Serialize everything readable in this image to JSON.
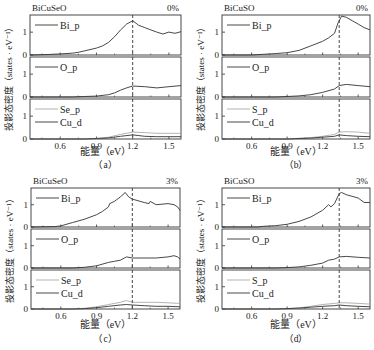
{
  "figure": {
    "ylabel": "投影态密度（states · eV⁻¹）",
    "xlabel": "能量（eV）",
    "xticks": [
      0.6,
      0.9,
      1.2,
      1.5
    ],
    "xlim": [
      0.35,
      1.6
    ],
    "ylim": [
      0,
      1.75
    ],
    "yticks": [
      0,
      1
    ]
  },
  "chart_data": [
    {
      "type": "line",
      "id": "a",
      "caption": "（a）",
      "title": "BiCuSeO",
      "strain": "0%",
      "fermi_dashed_x": 1.2,
      "xlabel": "能量（eV）",
      "ylabel": "投影态密度（states · eV⁻¹）",
      "xlim": [
        0.35,
        1.6
      ],
      "ylim": [
        0,
        1.75
      ],
      "panels": [
        {
          "series": [
            {
              "name": "Bi_p",
              "color": "#333333",
              "x": [
                0.35,
                0.5,
                0.6,
                0.7,
                0.75,
                0.8,
                0.9,
                0.95,
                1.0,
                1.05,
                1.1,
                1.15,
                1.2,
                1.25,
                1.3,
                1.35,
                1.4,
                1.45,
                1.5,
                1.55,
                1.6
              ],
              "y": [
                0,
                0.02,
                0.05,
                0.08,
                0.12,
                0.18,
                0.3,
                0.4,
                0.55,
                0.8,
                1.1,
                1.35,
                1.5,
                1.3,
                1.2,
                1.1,
                1.0,
                0.92,
                1.0,
                0.95,
                1.02
              ]
            }
          ]
        },
        {
          "series": [
            {
              "name": "O_p",
              "color": "#333333",
              "x": [
                0.35,
                0.7,
                0.8,
                0.9,
                1.0,
                1.05,
                1.1,
                1.15,
                1.2,
                1.3,
                1.4,
                1.5,
                1.6
              ],
              "y": [
                0,
                0,
                0.02,
                0.04,
                0.1,
                0.18,
                0.3,
                0.4,
                0.48,
                0.45,
                0.4,
                0.45,
                0.5
              ]
            }
          ]
        },
        {
          "series": [
            {
              "name": "Se_p",
              "color": "#aaaaaa",
              "x": [
                0.35,
                0.8,
                0.9,
                1.0,
                1.1,
                1.2,
                1.3,
                1.4,
                1.5,
                1.6
              ],
              "y": [
                0,
                0,
                0.02,
                0.08,
                0.2,
                0.3,
                0.28,
                0.25,
                0.25,
                0.25
              ]
            },
            {
              "name": "Cu_d",
              "color": "#333333",
              "x": [
                0.35,
                0.8,
                0.9,
                1.0,
                1.1,
                1.2,
                1.3,
                1.4,
                1.5,
                1.6
              ],
              "y": [
                0,
                0,
                0.02,
                0.05,
                0.12,
                0.18,
                0.12,
                0.1,
                0.1,
                0.1
              ]
            }
          ]
        }
      ]
    },
    {
      "type": "line",
      "id": "b",
      "caption": "（b）",
      "title": "BiCuSO",
      "strain": "0%",
      "fermi_dashed_x": 1.34,
      "xlabel": "能量（eV）",
      "ylabel": "投影态密度（states · eV⁻¹）",
      "xlim": [
        0.35,
        1.6
      ],
      "ylim": [
        0,
        1.75
      ],
      "panels": [
        {
          "series": [
            {
              "name": "Bi_p",
              "color": "#333333",
              "x": [
                0.35,
                0.6,
                0.7,
                0.8,
                0.9,
                1.0,
                1.1,
                1.2,
                1.25,
                1.3,
                1.33,
                1.36,
                1.4,
                1.45,
                1.5,
                1.55,
                1.6
              ],
              "y": [
                0,
                0,
                0.03,
                0.06,
                0.1,
                0.2,
                0.4,
                0.6,
                0.75,
                0.95,
                1.4,
                1.7,
                1.65,
                1.5,
                1.35,
                1.2,
                1.1
              ]
            }
          ]
        },
        {
          "series": [
            {
              "name": "O_p",
              "color": "#333333",
              "x": [
                0.35,
                0.8,
                0.9,
                1.0,
                1.1,
                1.2,
                1.3,
                1.34,
                1.4,
                1.5,
                1.6
              ],
              "y": [
                0,
                0,
                0.02,
                0.05,
                0.1,
                0.2,
                0.35,
                0.5,
                0.55,
                0.5,
                0.45
              ]
            }
          ]
        },
        {
          "series": [
            {
              "name": "S_p",
              "color": "#aaaaaa",
              "x": [
                0.35,
                0.9,
                1.0,
                1.1,
                1.2,
                1.3,
                1.34,
                1.4,
                1.5,
                1.6
              ],
              "y": [
                0,
                0,
                0.03,
                0.06,
                0.12,
                0.2,
                0.3,
                0.32,
                0.3,
                0.25
              ]
            },
            {
              "name": "Cu_d",
              "color": "#333333",
              "x": [
                0.35,
                0.9,
                1.0,
                1.1,
                1.2,
                1.3,
                1.34,
                1.4,
                1.5,
                1.6
              ],
              "y": [
                0,
                0,
                0.02,
                0.04,
                0.08,
                0.12,
                0.18,
                0.15,
                0.12,
                0.1
              ]
            }
          ]
        }
      ]
    },
    {
      "type": "line",
      "id": "c",
      "caption": "（c）",
      "title": "BiCuSeO",
      "strain": "3%",
      "fermi_dashed_x": 1.2,
      "xlabel": "能量（eV）",
      "ylabel": "投影态密度（states · eV⁻¹）",
      "xlim": [
        0.35,
        1.6
      ],
      "ylim": [
        0,
        1.75
      ],
      "panels": [
        {
          "series": [
            {
              "name": "Bi_p",
              "color": "#333333",
              "x": [
                0.35,
                0.55,
                0.6,
                0.7,
                0.8,
                0.9,
                0.95,
                1.0,
                1.01,
                1.05,
                1.1,
                1.14,
                1.17,
                1.2,
                1.3,
                1.34,
                1.35,
                1.4,
                1.5,
                1.55,
                1.58,
                1.6
              ],
              "y": [
                0,
                0.02,
                0.05,
                0.2,
                0.35,
                0.55,
                0.7,
                0.9,
                1.05,
                1.15,
                1.35,
                1.55,
                1.35,
                1.25,
                1.1,
                1.05,
                1.15,
                1.0,
                1.05,
                1.0,
                0.9,
                0.75
              ]
            }
          ]
        },
        {
          "series": [
            {
              "name": "O_p",
              "color": "#333333",
              "x": [
                0.35,
                0.7,
                0.8,
                0.9,
                1.0,
                1.05,
                1.1,
                1.15,
                1.2,
                1.3,
                1.4,
                1.5,
                1.55,
                1.58,
                1.6
              ],
              "y": [
                0,
                0,
                0.03,
                0.1,
                0.25,
                0.3,
                0.35,
                0.5,
                0.45,
                0.45,
                0.45,
                0.5,
                0.55,
                0.5,
                0.4
              ]
            }
          ]
        },
        {
          "series": [
            {
              "name": "Se_p",
              "color": "#aaaaaa",
              "x": [
                0.35,
                0.7,
                0.8,
                0.9,
                1.0,
                1.1,
                1.15,
                1.2,
                1.3,
                1.4,
                1.5,
                1.6
              ],
              "y": [
                0,
                0,
                0.03,
                0.1,
                0.2,
                0.3,
                0.38,
                0.3,
                0.3,
                0.3,
                0.28,
                0.25
              ]
            },
            {
              "name": "Cu_d",
              "color": "#333333",
              "x": [
                0.35,
                0.7,
                0.8,
                0.9,
                1.0,
                1.1,
                1.15,
                1.2,
                1.3,
                1.4,
                1.5,
                1.6
              ],
              "y": [
                0,
                0,
                0.02,
                0.06,
                0.12,
                0.18,
                0.2,
                0.18,
                0.15,
                0.12,
                0.12,
                0.1
              ]
            }
          ]
        }
      ]
    },
    {
      "type": "line",
      "id": "d",
      "caption": "（d）",
      "title": "BiCuSO",
      "strain": "3%",
      "fermi_dashed_x": 1.34,
      "xlabel": "能量（eV）",
      "ylabel": "投影态密度（states · eV⁻¹）",
      "xlim": [
        0.35,
        1.6
      ],
      "ylim": [
        0,
        1.75
      ],
      "panels": [
        {
          "series": [
            {
              "name": "Bi_p",
              "color": "#333333",
              "x": [
                0.35,
                0.65,
                0.7,
                0.8,
                0.9,
                1.0,
                1.1,
                1.2,
                1.25,
                1.27,
                1.3,
                1.34,
                1.36,
                1.4,
                1.5,
                1.55,
                1.6
              ],
              "y": [
                0,
                0,
                0.03,
                0.06,
                0.12,
                0.25,
                0.45,
                0.75,
                1.0,
                0.9,
                1.05,
                1.5,
                1.55,
                1.45,
                1.3,
                1.1,
                1.1
              ]
            }
          ]
        },
        {
          "series": [
            {
              "name": "O_p",
              "color": "#333333",
              "x": [
                0.35,
                0.8,
                0.9,
                1.0,
                1.1,
                1.2,
                1.25,
                1.3,
                1.34,
                1.4,
                1.5,
                1.6
              ],
              "y": [
                0,
                0,
                0.02,
                0.05,
                0.12,
                0.22,
                0.35,
                0.4,
                0.5,
                0.52,
                0.48,
                0.45
              ]
            }
          ]
        },
        {
          "series": [
            {
              "name": "S_p",
              "color": "#aaaaaa",
              "x": [
                0.35,
                0.8,
                0.9,
                1.0,
                1.1,
                1.2,
                1.3,
                1.34,
                1.4,
                1.5,
                1.6
              ],
              "y": [
                0,
                0,
                0.02,
                0.05,
                0.12,
                0.2,
                0.25,
                0.28,
                0.28,
                0.25,
                0.22
              ]
            },
            {
              "name": "Cu_d",
              "color": "#333333",
              "x": [
                0.35,
                0.8,
                0.9,
                1.0,
                1.1,
                1.2,
                1.3,
                1.34,
                1.4,
                1.5,
                1.6
              ],
              "y": [
                0,
                0,
                0.02,
                0.04,
                0.08,
                0.12,
                0.15,
                0.18,
                0.15,
                0.12,
                0.1
              ]
            }
          ]
        }
      ]
    }
  ],
  "layout_hints": {
    "figures": [
      {
        "left": 30,
        "right": 181,
        "top": 15,
        "panel_h": 40,
        "gap": 2,
        "tick_y_offset": 10,
        "cap_y": 168,
        "xlabel_y": 155
      },
      {
        "left": 222,
        "right": 370,
        "top": 15,
        "panel_h": 40,
        "gap": 2,
        "tick_y_offset": 10,
        "cap_y": 168,
        "xlabel_y": 155
      },
      {
        "left": 31,
        "right": 180,
        "top": 188,
        "panel_h": 39,
        "gap": 2,
        "tick_y_offset": 10,
        "cap_y": 342,
        "xlabel_y": 328
      },
      {
        "left": 222,
        "right": 370,
        "top": 188,
        "panel_h": 39,
        "gap": 2,
        "tick_y_offset": 10,
        "cap_y": 342,
        "xlabel_y": 328
      }
    ]
  }
}
